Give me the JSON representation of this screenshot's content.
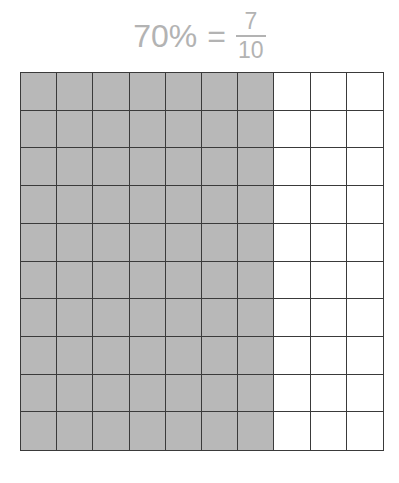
{
  "title": {
    "percent": "70%",
    "equals": "=",
    "numerator": "7",
    "denominator": "10"
  },
  "grid": {
    "rows": 10,
    "columns": 10,
    "shaded_columns": 7,
    "shaded_color": "#b8b8b8",
    "unshaded_color": "#ffffff",
    "line_color": "#3a3a3a"
  },
  "colors": {
    "title_text": "#b3b3b3"
  }
}
